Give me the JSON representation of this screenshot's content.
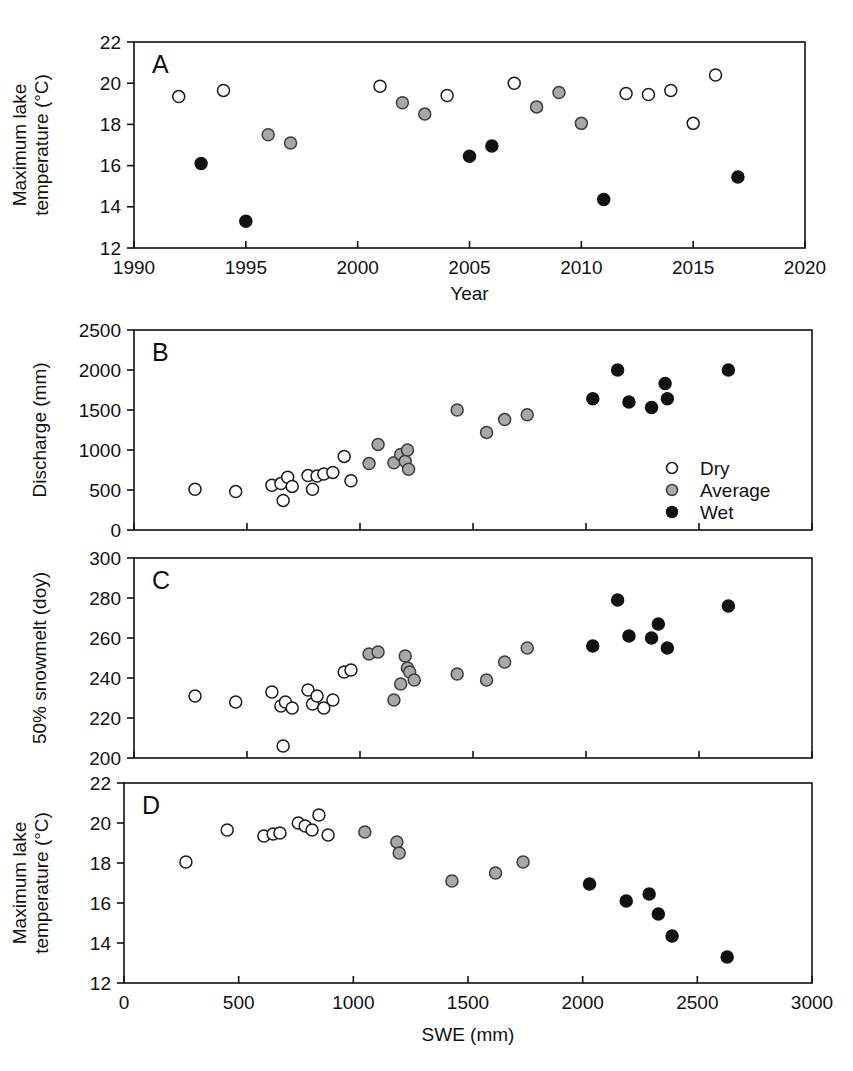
{
  "figure": {
    "background": "#ffffff",
    "series_colors": {
      "Dry": "#ffffff",
      "Average": "#a8a8a8",
      "Wet": "#111111"
    },
    "legend": {
      "position": "inside panel B, lower right",
      "entries": [
        {
          "label": "Dry",
          "marker": "open-circle"
        },
        {
          "label": "Average",
          "marker": "gray-circle"
        },
        {
          "label": "Wet",
          "marker": "filled-circle"
        }
      ]
    },
    "panel_letters": [
      "A",
      "B",
      "C",
      "D"
    ]
  },
  "chart_data": [
    {
      "panel": "A",
      "type": "scatter",
      "title": "",
      "xlabel": "Year",
      "ylabel": "Maximum lake temperature (°C)",
      "xlim": [
        1990,
        2020
      ],
      "ylim": [
        12,
        22
      ],
      "xticks": [
        1990,
        1995,
        2000,
        2005,
        2010,
        2015,
        2020
      ],
      "yticks": [
        12,
        14,
        16,
        18,
        20,
        22
      ],
      "grid": false,
      "series": [
        {
          "name": "Dry",
          "points": [
            {
              "x": 1992,
              "y": 19.35
            },
            {
              "x": 1994,
              "y": 19.65
            },
            {
              "x": 2001,
              "y": 19.85
            },
            {
              "x": 2004,
              "y": 19.4
            },
            {
              "x": 2007,
              "y": 20.0
            },
            {
              "x": 2012,
              "y": 19.5
            },
            {
              "x": 2013,
              "y": 19.45
            },
            {
              "x": 2014,
              "y": 19.65
            },
            {
              "x": 2015,
              "y": 18.05
            },
            {
              "x": 2016,
              "y": 20.4
            }
          ]
        },
        {
          "name": "Average",
          "points": [
            {
              "x": 1996,
              "y": 17.5
            },
            {
              "x": 1997,
              "y": 17.1
            },
            {
              "x": 2002,
              "y": 19.05
            },
            {
              "x": 2003,
              "y": 18.5
            },
            {
              "x": 2008,
              "y": 18.85
            },
            {
              "x": 2009,
              "y": 19.55
            },
            {
              "x": 2010,
              "y": 18.05
            }
          ]
        },
        {
          "name": "Wet",
          "points": [
            {
              "x": 1993,
              "y": 16.1
            },
            {
              "x": 1995,
              "y": 13.3
            },
            {
              "x": 2005,
              "y": 16.45
            },
            {
              "x": 2006,
              "y": 16.95
            },
            {
              "x": 2011,
              "y": 14.35
            },
            {
              "x": 2017,
              "y": 15.45
            }
          ]
        }
      ]
    },
    {
      "panel": "B",
      "type": "scatter",
      "title": "",
      "xlabel": "SWE (mm)",
      "ylabel": "Discharge (mm)",
      "xlim": [
        0,
        3000
      ],
      "ylim": [
        0,
        2500
      ],
      "xticks": [
        0,
        500,
        1000,
        1500,
        2000,
        2500,
        3000
      ],
      "yticks": [
        0,
        500,
        1000,
        1500,
        2000,
        2500
      ],
      "grid": false,
      "series": [
        {
          "name": "Dry",
          "points": [
            {
              "x": 270,
              "y": 510
            },
            {
              "x": 450,
              "y": 480
            },
            {
              "x": 610,
              "y": 560
            },
            {
              "x": 650,
              "y": 580
            },
            {
              "x": 660,
              "y": 370
            },
            {
              "x": 680,
              "y": 660
            },
            {
              "x": 700,
              "y": 545
            },
            {
              "x": 770,
              "y": 680
            },
            {
              "x": 790,
              "y": 510
            },
            {
              "x": 810,
              "y": 675
            },
            {
              "x": 840,
              "y": 700
            },
            {
              "x": 880,
              "y": 720
            },
            {
              "x": 930,
              "y": 920
            },
            {
              "x": 960,
              "y": 615
            }
          ]
        },
        {
          "name": "Average",
          "points": [
            {
              "x": 1040,
              "y": 830
            },
            {
              "x": 1080,
              "y": 1070
            },
            {
              "x": 1150,
              "y": 840
            },
            {
              "x": 1180,
              "y": 945
            },
            {
              "x": 1200,
              "y": 860
            },
            {
              "x": 1210,
              "y": 1000
            },
            {
              "x": 1215,
              "y": 760
            },
            {
              "x": 1430,
              "y": 1500
            },
            {
              "x": 1560,
              "y": 1220
            },
            {
              "x": 1640,
              "y": 1380
            },
            {
              "x": 1740,
              "y": 1440
            }
          ]
        },
        {
          "name": "Wet",
          "points": [
            {
              "x": 2030,
              "y": 1640
            },
            {
              "x": 2140,
              "y": 2000
            },
            {
              "x": 2190,
              "y": 1600
            },
            {
              "x": 2290,
              "y": 1530
            },
            {
              "x": 2350,
              "y": 1830
            },
            {
              "x": 2360,
              "y": 1640
            },
            {
              "x": 2630,
              "y": 2000
            }
          ]
        }
      ]
    },
    {
      "panel": "C",
      "type": "scatter",
      "title": "",
      "xlabel": "SWE (mm)",
      "ylabel": "50% snowmelt (doy)",
      "xlim": [
        0,
        3000
      ],
      "ylim": [
        200,
        300
      ],
      "xticks": [
        0,
        500,
        1000,
        1500,
        2000,
        2500,
        3000
      ],
      "yticks": [
        200,
        220,
        240,
        260,
        280,
        300
      ],
      "grid": false,
      "series": [
        {
          "name": "Dry",
          "points": [
            {
              "x": 270,
              "y": 231
            },
            {
              "x": 450,
              "y": 228
            },
            {
              "x": 610,
              "y": 233
            },
            {
              "x": 650,
              "y": 226
            },
            {
              "x": 660,
              "y": 206
            },
            {
              "x": 670,
              "y": 228
            },
            {
              "x": 700,
              "y": 225
            },
            {
              "x": 770,
              "y": 234
            },
            {
              "x": 790,
              "y": 227
            },
            {
              "x": 810,
              "y": 231
            },
            {
              "x": 840,
              "y": 225
            },
            {
              "x": 880,
              "y": 229
            },
            {
              "x": 930,
              "y": 243
            },
            {
              "x": 960,
              "y": 244
            }
          ]
        },
        {
          "name": "Average",
          "points": [
            {
              "x": 1040,
              "y": 252
            },
            {
              "x": 1080,
              "y": 253
            },
            {
              "x": 1150,
              "y": 229
            },
            {
              "x": 1180,
              "y": 237
            },
            {
              "x": 1200,
              "y": 251
            },
            {
              "x": 1210,
              "y": 245
            },
            {
              "x": 1220,
              "y": 243
            },
            {
              "x": 1240,
              "y": 239
            },
            {
              "x": 1430,
              "y": 242
            },
            {
              "x": 1560,
              "y": 239
            },
            {
              "x": 1640,
              "y": 248
            },
            {
              "x": 1740,
              "y": 255
            }
          ]
        },
        {
          "name": "Wet",
          "points": [
            {
              "x": 2030,
              "y": 256
            },
            {
              "x": 2140,
              "y": 279
            },
            {
              "x": 2190,
              "y": 261
            },
            {
              "x": 2290,
              "y": 260
            },
            {
              "x": 2320,
              "y": 267
            },
            {
              "x": 2360,
              "y": 255
            },
            {
              "x": 2630,
              "y": 276
            }
          ]
        }
      ]
    },
    {
      "panel": "D",
      "type": "scatter",
      "title": "",
      "xlabel": "SWE (mm)",
      "ylabel": "Maximum lake temperature (°C)",
      "xlim": [
        0,
        3000
      ],
      "ylim": [
        12,
        22
      ],
      "xticks": [
        0,
        500,
        1000,
        1500,
        2000,
        2500,
        3000
      ],
      "yticks": [
        12,
        14,
        16,
        18,
        20,
        22
      ],
      "grid": false,
      "series": [
        {
          "name": "Dry",
          "points": [
            {
              "x": 270,
              "y": 18.05
            },
            {
              "x": 450,
              "y": 19.65
            },
            {
              "x": 610,
              "y": 19.35
            },
            {
              "x": 650,
              "y": 19.45
            },
            {
              "x": 680,
              "y": 19.5
            },
            {
              "x": 760,
              "y": 20.0
            },
            {
              "x": 790,
              "y": 19.85
            },
            {
              "x": 820,
              "y": 19.65
            },
            {
              "x": 850,
              "y": 20.4
            },
            {
              "x": 890,
              "y": 19.4
            }
          ]
        },
        {
          "name": "Average",
          "points": [
            {
              "x": 1050,
              "y": 19.55
            },
            {
              "x": 1190,
              "y": 19.05
            },
            {
              "x": 1200,
              "y": 18.5
            },
            {
              "x": 1430,
              "y": 17.1
            },
            {
              "x": 1620,
              "y": 17.5
            },
            {
              "x": 1740,
              "y": 18.05
            }
          ]
        },
        {
          "name": "Wet",
          "points": [
            {
              "x": 2030,
              "y": 16.95
            },
            {
              "x": 2190,
              "y": 16.1
            },
            {
              "x": 2290,
              "y": 16.45
            },
            {
              "x": 2330,
              "y": 15.45
            },
            {
              "x": 2390,
              "y": 14.35
            },
            {
              "x": 2630,
              "y": 13.3
            }
          ]
        }
      ]
    }
  ]
}
